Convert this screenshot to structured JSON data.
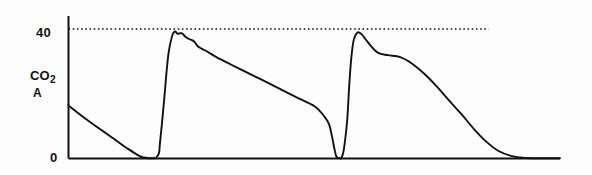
{
  "figure": {
    "background_color": "#fdfdfd",
    "ink_color": "#111111",
    "y_axis": {
      "label_top": "CO",
      "label_top_sub": "2",
      "label_bottom": "A",
      "ticks": [
        {
          "value": 40,
          "text": "40"
        },
        {
          "value": 0,
          "text": "0"
        }
      ]
    },
    "reference_line": {
      "value": 40,
      "style": "dotted",
      "label": "40"
    }
  },
  "chart_data": {
    "type": "line",
    "title": "",
    "xlabel": "",
    "ylabel": "CO2 A",
    "xlim": [
      0,
      100
    ],
    "ylim": [
      0,
      44
    ],
    "grid": false,
    "legend": null,
    "annotations": [
      {
        "text": "40",
        "kind": "y-tick",
        "y": 40
      },
      {
        "text": "0",
        "kind": "y-tick",
        "y": 0
      },
      {
        "text": "CO2",
        "kind": "axis-title"
      },
      {
        "text": "A",
        "kind": "axis-title"
      }
    ],
    "reference_lines": [
      {
        "y": 40,
        "style": "dotted",
        "x_start": 0,
        "x_end": 85.5
      }
    ],
    "series": [
      {
        "name": "CO2 waveform",
        "color": "#111111",
        "x": [
          0.0,
          2.0,
          4.1,
          6.1,
          8.2,
          10.2,
          12.2,
          14.3,
          15.3,
          16.3,
          17.3,
          17.8,
          18.4,
          18.6,
          19.0,
          19.6,
          20.0,
          20.4,
          21.0,
          21.4,
          21.8,
          22.2,
          23.0,
          23.8,
          24.5,
          25.5,
          26.5,
          28.0,
          30.0,
          34.0,
          38.0,
          42.0,
          46.0,
          50.0,
          52.0,
          53.0,
          53.6,
          54.1,
          54.5,
          55.1,
          55.5,
          56.0,
          56.7,
          57.1,
          57.5,
          58.0,
          58.8,
          59.6,
          60.4,
          61.6,
          63.0,
          65.0,
          67.5,
          70.0,
          72.5,
          75.0,
          77.5,
          80.0,
          82.5,
          85.0,
          87.5,
          90.0,
          92.0,
          94.0,
          96.0,
          98.0,
          100.0
        ],
        "y": [
          16.4,
          14.0,
          11.6,
          9.4,
          7.2,
          5.0,
          2.9,
          0.9,
          0.3,
          0.1,
          0.1,
          0.2,
          1.6,
          4.6,
          10.6,
          20.5,
          27.6,
          33.0,
          37.4,
          38.9,
          39.2,
          38.5,
          38.7,
          37.6,
          36.9,
          36.2,
          34.4,
          33.2,
          31.4,
          28.3,
          25.3,
          22.3,
          19.2,
          16.2,
          13.1,
          10.6,
          6.9,
          3.0,
          0.6,
          0.1,
          0.2,
          2.6,
          11.8,
          22.2,
          30.4,
          36.4,
          38.9,
          38.4,
          36.9,
          34.6,
          32.6,
          31.9,
          31.3,
          29.2,
          26.0,
          22.1,
          17.8,
          13.6,
          9.1,
          5.2,
          2.3,
          0.8,
          0.3,
          0.1,
          0.1,
          0.1,
          0.1
        ]
      }
    ]
  }
}
